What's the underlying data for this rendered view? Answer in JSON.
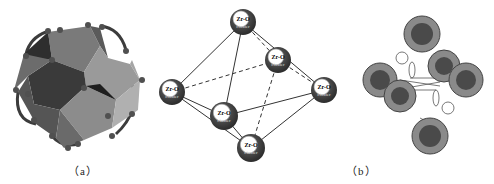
{
  "figure": {
    "panels": [
      {
        "id": "a",
        "caption": "（a）",
        "description": "Polyhedral model of Zr6 oxo cluster with linkers"
      },
      {
        "id": "b",
        "caption": "（b）",
        "description": "Octahedral arrangement of Zr-O cluster nodes"
      },
      {
        "id": "c",
        "description": "Packed framework of clusters connected by linkers"
      }
    ],
    "node_label_line1": "Zr-O",
    "node_label_line2": "cluster",
    "nodes": [
      {
        "name": "top",
        "x": 93,
        "y": 22,
        "r": 13
      },
      {
        "name": "back-right",
        "x": 128,
        "y": 60,
        "r": 13
      },
      {
        "name": "left",
        "x": 22,
        "y": 92,
        "r": 13
      },
      {
        "name": "right",
        "x": 174,
        "y": 90,
        "r": 13
      },
      {
        "name": "front",
        "x": 74,
        "y": 116,
        "r": 14
      },
      {
        "name": "bottom",
        "x": 101,
        "y": 148,
        "r": 14
      }
    ],
    "colors": {
      "node_fill": "#3a3a3a",
      "node_highlight": "#ffffff",
      "edge": "#333333",
      "polyhedron_dark": "#2e2e2e",
      "polyhedron_mid": "#6e6e6e",
      "polyhedron_light": "#a5a5a5",
      "caption": "#222222"
    }
  }
}
